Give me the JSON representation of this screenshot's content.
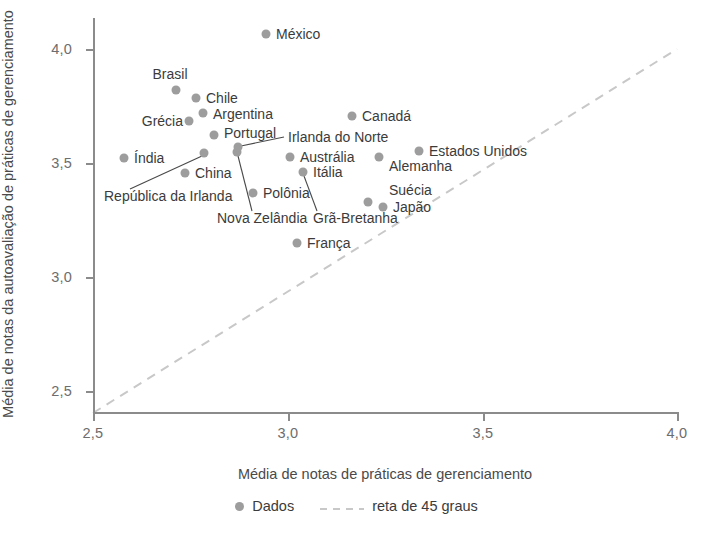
{
  "chart_data": {
    "type": "scatter",
    "title": "",
    "xlabel": "Média de notas de práticas de gerenciamento",
    "ylabel": "Média de notas da autoavaliação de práticas de gerenciamento",
    "xlim": [
      2.5,
      4.0
    ],
    "ylim": [
      2.5,
      4.12
    ],
    "grid": false,
    "xticks": [
      "2,5",
      "3,0",
      "3,5",
      "4,0"
    ],
    "xtick_values": [
      2.5,
      3.0,
      3.5,
      4.0
    ],
    "yticks": [
      "2,5",
      "3,0",
      "3,5",
      "4,0"
    ],
    "ytick_values": [
      2.5,
      3.0,
      3.5,
      4.0
    ],
    "legend_position": "bottom-center",
    "legend": [
      {
        "label": "Dados",
        "marker": "dot",
        "color": "#9d9d9d"
      },
      {
        "label": "reta de 45 graus",
        "marker": "dashed-line",
        "color": "#c8c8c8"
      }
    ],
    "reference_line": {
      "label": "reta de 45 graus",
      "type": "identity",
      "from": [
        2.5,
        2.5
      ],
      "to": [
        4.0,
        4.0
      ]
    },
    "points": [
      {
        "name": "México",
        "x": 2.94,
        "y": 4.07,
        "px": 266,
        "py": 34,
        "lx": 276,
        "ly": 34,
        "anchor": "left"
      },
      {
        "name": "Brasil",
        "x": 2.71,
        "y": 3.83,
        "px": 176,
        "py": 90,
        "lx": 170,
        "ly": 74,
        "anchor": "center"
      },
      {
        "name": "Chile",
        "x": 2.76,
        "y": 3.79,
        "px": 196,
        "py": 98,
        "lx": 206,
        "ly": 98,
        "anchor": "left"
      },
      {
        "name": "Argentina",
        "x": 2.78,
        "y": 3.72,
        "px": 203,
        "py": 113,
        "lx": 213,
        "ly": 114,
        "anchor": "left"
      },
      {
        "name": "Grécia",
        "x": 2.75,
        "y": 3.69,
        "px": 189,
        "py": 121,
        "lx": 183,
        "ly": 121,
        "anchor": "right"
      },
      {
        "name": "Portugal",
        "x": 2.81,
        "y": 3.63,
        "px": 214,
        "py": 135,
        "lx": 224,
        "ly": 133,
        "anchor": "left"
      },
      {
        "name": "Índia",
        "x": 2.58,
        "y": 3.55,
        "px": 124,
        "py": 158,
        "lx": 134,
        "ly": 158,
        "anchor": "left"
      },
      {
        "name": "República da Irlanda",
        "x": 2.79,
        "y": 3.57,
        "px": 204,
        "py": 153,
        "lx": 104,
        "ly": 196,
        "anchor": "left"
      },
      {
        "name": "China",
        "x": 2.74,
        "y": 3.49,
        "px": 185,
        "py": 173,
        "lx": 195,
        "ly": 173,
        "anchor": "left"
      },
      {
        "name": "Nova Zelândia",
        "x": 2.87,
        "y": 3.58,
        "px": 237,
        "py": 152,
        "lx": 217,
        "ly": 218,
        "anchor": "left"
      },
      {
        "name": "Irlanda do Norte",
        "x": 2.87,
        "y": 3.61,
        "px": 238,
        "py": 147,
        "lx": 288,
        "ly": 137,
        "anchor": "left"
      },
      {
        "name": "Austrália",
        "x": 3.0,
        "y": 3.56,
        "px": 290,
        "py": 157,
        "lx": 300,
        "ly": 157,
        "anchor": "left"
      },
      {
        "name": "Itália",
        "x": 3.04,
        "y": 3.5,
        "px": 303,
        "py": 172,
        "lx": 313,
        "ly": 172,
        "anchor": "left"
      },
      {
        "name": "Polônia",
        "x": 2.91,
        "y": 3.45,
        "px": 253,
        "py": 193,
        "lx": 263,
        "ly": 193,
        "anchor": "left"
      },
      {
        "name": "Grã-Bretanha",
        "x": 3.04,
        "y": 3.5,
        "px": 303,
        "py": 172,
        "lx": 313,
        "ly": 218,
        "anchor": "left"
      },
      {
        "name": "Canadá",
        "x": 3.17,
        "y": 3.72,
        "px": 352,
        "py": 116,
        "lx": 362,
        "ly": 116,
        "anchor": "left"
      },
      {
        "name": "Estados Unidos",
        "x": 3.34,
        "y": 3.58,
        "px": 419,
        "py": 151,
        "lx": 429,
        "ly": 151,
        "anchor": "left"
      },
      {
        "name": "Alemanha",
        "x": 3.23,
        "y": 3.56,
        "px": 379,
        "py": 157,
        "lx": 389,
        "ly": 166,
        "anchor": "left"
      },
      {
        "name": "Suécia",
        "x": 3.21,
        "y": 3.38,
        "px": 368,
        "py": 202,
        "lx": 389,
        "ly": 190,
        "anchor": "left"
      },
      {
        "name": "Japão",
        "x": 3.25,
        "y": 3.36,
        "px": 383,
        "py": 207,
        "lx": 393,
        "ly": 207,
        "anchor": "left"
      },
      {
        "name": "França",
        "x": 3.02,
        "y": 3.2,
        "px": 297,
        "py": 243,
        "lx": 307,
        "ly": 243,
        "anchor": "left"
      }
    ],
    "leaders": [
      {
        "name": "República da Irlanda",
        "x1": 202,
        "y1": 156,
        "x2": 130,
        "y2": 189
      },
      {
        "name": "Nova Zelândia",
        "x1": 238,
        "y1": 156,
        "x2": 252,
        "y2": 211
      },
      {
        "name": "Irlanda do Norte",
        "x1": 241,
        "y1": 146,
        "x2": 284,
        "y2": 137
      },
      {
        "name": "Grã-Bretanha",
        "x1": 304,
        "y1": 176,
        "x2": 317,
        "y2": 211
      }
    ]
  }
}
